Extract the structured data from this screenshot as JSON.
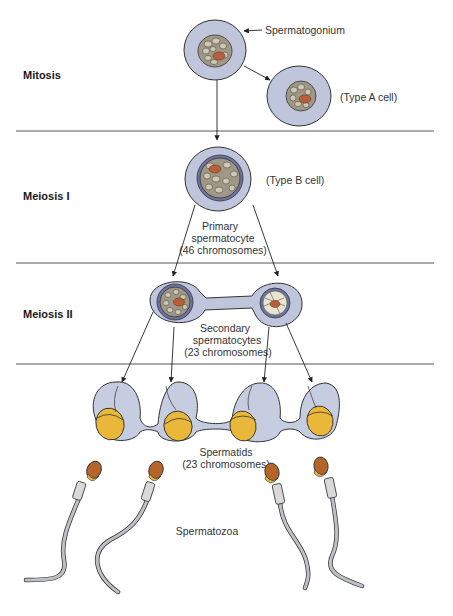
{
  "figure": {
    "stages": [
      {
        "label": "Mitosis"
      },
      {
        "label": "Meiosis I"
      },
      {
        "label": "Meiosis II"
      }
    ],
    "labels": {
      "spermatogonium": "Spermatogonium",
      "type_a": "(Type A cell)",
      "type_b": "(Type B cell)",
      "primary_line1": "Primary",
      "primary_line2": "spermatocyte",
      "primary_line3": "(46 chromosomes)",
      "secondary_line1": "Secondary",
      "secondary_line2": "spermatocytes",
      "secondary_line3": "(23 chromosomes)",
      "spermatids_line1": "Spermatids",
      "spermatids_line2": "(23 chromosomes)",
      "spermatozoa": "Spermatozoa"
    },
    "counts": {
      "spermatids": 4,
      "spermatozoa": 4
    },
    "colors": {
      "cytoplasm": "#bfc6dc",
      "nuclear_envelope": "#6c73a3",
      "chromatin": "#cfc8b3",
      "nucleolus": "#b5603b",
      "spermatid_nucleus": "#e9b83a",
      "sperm_head": "#b5642a",
      "tail": "#bfc0c6"
    }
  }
}
